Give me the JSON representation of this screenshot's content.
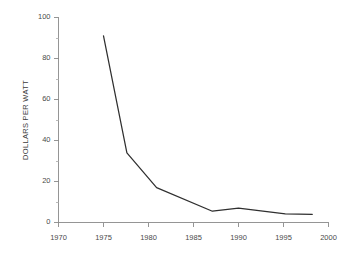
{
  "chart_data": {
    "type": "line",
    "title": "",
    "subtitle": "",
    "xlabel": "",
    "ylabel": "DOLLARS PER WATT",
    "xlim": [
      1970,
      2000
    ],
    "ylim": [
      0,
      100
    ],
    "grid": false,
    "legend": false,
    "legend_position": "none",
    "x_ticks": [
      1970,
      1975,
      1980,
      1985,
      1990,
      1995,
      2000
    ],
    "x_tick_labels": [
      "1970",
      "1975",
      "1980",
      "1985",
      "1990",
      "1995",
      "2000"
    ],
    "y_ticks": [
      0,
      20,
      40,
      60,
      80,
      100
    ],
    "y_tick_labels": [
      "0",
      "20",
      "40",
      "60",
      "80",
      "100"
    ],
    "y_minor_ticks": [
      10,
      30,
      50,
      70,
      90
    ],
    "series": [
      {
        "name": "Dollars per watt",
        "color": "#2f2f2f",
        "x": [
          1975,
          1977.6,
          1980.9,
          1987.1,
          1990.0,
          1995.2,
          1998.2
        ],
        "values": [
          91,
          34,
          17,
          5.5,
          7,
          4.2,
          4
        ]
      }
    ]
  },
  "colors": {
    "background": "#ffffff",
    "axis": "#8a8a8a",
    "minor_tick": "#a8a8a8",
    "tick_text": "#4a4a4a",
    "axis_title": "#3c3c3c",
    "series": "#2f2f2f"
  }
}
